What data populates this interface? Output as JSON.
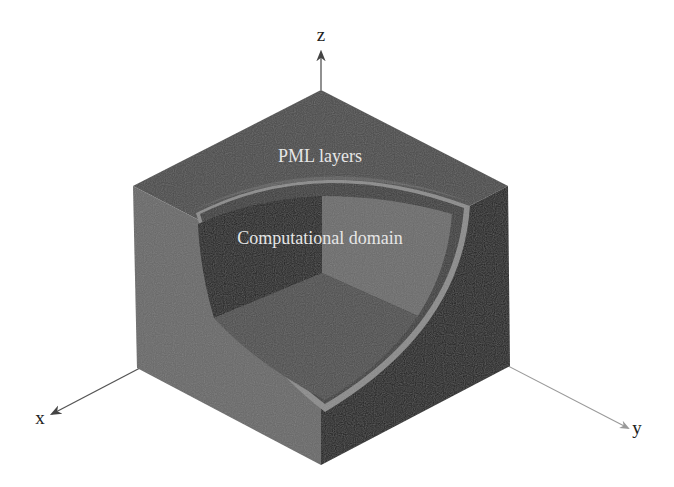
{
  "figure": {
    "type": "3d-cube-cutaway",
    "labels": {
      "top_region": "PML layers",
      "inner_region": "Computational domain"
    },
    "axes": {
      "x": "x",
      "y": "y",
      "z": "z"
    },
    "colors": {
      "background": "#ffffff",
      "top_face": "#4a4a4a",
      "left_face": "#676767",
      "right_face": "#1f1f1f",
      "inner_back_left_wall": "#1c1c1c",
      "inner_back_right_wall": "#6a6a6a",
      "inner_floor": "#4d4d4d",
      "sphere_rim": "#8a8a8a",
      "axis_line": "#555555",
      "label_text": "#e6e6e6"
    }
  }
}
